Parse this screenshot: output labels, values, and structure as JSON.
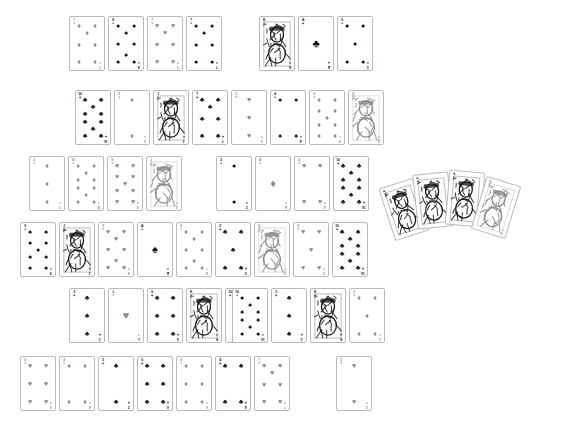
{
  "scene": {
    "title": "Playing Cards Layout",
    "background_color": "#ffffff",
    "card_border_color": "#b9b9b9",
    "red_suit_color": "#8a8a8a",
    "black_suit_color": "#111111",
    "card_width": 36,
    "card_height": 55
  },
  "suits": {
    "spades": "♠",
    "hearts": "♥",
    "diamonds": "♦",
    "clubs": "♣"
  },
  "grid": {
    "rows": [
      {
        "row_index": 1,
        "y": 16,
        "cards": [
          {
            "rank": "7",
            "suit": "diamonds",
            "color": "red",
            "x": 69,
            "face": false
          },
          {
            "rank": "8",
            "suit": "spades",
            "color": "black",
            "x": 108,
            "face": false
          },
          {
            "rank": "7",
            "suit": "hearts",
            "color": "red",
            "x": 147,
            "face": false
          },
          {
            "rank": "7",
            "suit": "spades",
            "color": "black",
            "x": 186,
            "face": false
          },
          {
            "rank": "K",
            "suit": "spades",
            "color": "black",
            "x": 259,
            "face": true
          },
          {
            "rank": "A",
            "suit": "clubs",
            "color": "black",
            "x": 298,
            "face": false
          },
          {
            "rank": "5",
            "suit": "spades",
            "color": "black",
            "x": 337,
            "face": false
          }
        ]
      },
      {
        "row_index": 2,
        "y": 90,
        "cards": [
          {
            "rank": "10",
            "suit": "clubs",
            "color": "black",
            "x": 75,
            "face": false
          },
          {
            "rank": "2",
            "suit": "diamonds",
            "color": "red",
            "x": 114,
            "face": false
          },
          {
            "rank": "J",
            "suit": "spades",
            "color": "black",
            "x": 153,
            "face": true
          },
          {
            "rank": "7",
            "suit": "clubs",
            "color": "black",
            "x": 192,
            "face": false
          },
          {
            "rank": "3",
            "suit": "hearts",
            "color": "red",
            "x": 231,
            "face": false
          },
          {
            "rank": "4",
            "suit": "spades",
            "color": "black",
            "x": 270,
            "face": false
          },
          {
            "rank": "9",
            "suit": "diamonds",
            "color": "red",
            "x": 309,
            "face": false
          },
          {
            "rank": "Q",
            "suit": "hearts",
            "color": "red",
            "x": 348,
            "face": true
          }
        ]
      },
      {
        "row_index": 3,
        "y": 156,
        "cards": [
          {
            "rank": "3",
            "suit": "diamonds",
            "color": "red",
            "x": 29,
            "face": false
          },
          {
            "rank": "10",
            "suit": "diamonds",
            "color": "red",
            "x": 68,
            "face": false
          },
          {
            "rank": "9",
            "suit": "hearts",
            "color": "red",
            "x": 107,
            "face": false
          },
          {
            "rank": "J",
            "suit": "diamonds",
            "color": "red",
            "x": 146,
            "face": true
          },
          {
            "rank": "2",
            "suit": "spades",
            "color": "black",
            "x": 216,
            "face": false
          },
          {
            "rank": "A",
            "suit": "diamonds",
            "color": "red",
            "x": 255,
            "face": false
          },
          {
            "rank": "4",
            "suit": "hearts",
            "color": "red",
            "x": 294,
            "face": false
          },
          {
            "rank": "10",
            "suit": "clubs",
            "color": "black",
            "x": 333,
            "face": false
          }
        ]
      },
      {
        "row_index": 4,
        "y": 222,
        "cards": [
          {
            "rank": "9",
            "suit": "spades",
            "color": "black",
            "x": 20,
            "face": false
          },
          {
            "rank": "J",
            "suit": "clubs",
            "color": "black",
            "x": 59,
            "face": true
          },
          {
            "rank": "8",
            "suit": "hearts",
            "color": "red",
            "x": 98,
            "face": false
          },
          {
            "rank": "A",
            "suit": "spades",
            "color": "black",
            "x": 137,
            "face": false
          },
          {
            "rank": "8",
            "suit": "diamonds",
            "color": "red",
            "x": 176,
            "face": false
          },
          {
            "rank": "5",
            "suit": "clubs",
            "color": "black",
            "x": 215,
            "face": false
          },
          {
            "rank": "Q",
            "suit": "diamonds",
            "color": "red",
            "x": 254,
            "face": true
          },
          {
            "rank": "5",
            "suit": "hearts",
            "color": "red",
            "x": 293,
            "face": false
          },
          {
            "rank": "10",
            "suit": "clubs",
            "color": "black",
            "x": 332,
            "face": false
          }
        ]
      },
      {
        "row_index": 5,
        "y": 288,
        "cards": [
          {
            "rank": "3",
            "suit": "clubs",
            "color": "black",
            "x": 69,
            "face": false
          },
          {
            "rank": "A",
            "suit": "hearts",
            "color": "red",
            "x": 108,
            "face": false
          },
          {
            "rank": "6",
            "suit": "clubs",
            "color": "black",
            "x": 147,
            "face": false
          },
          {
            "rank": "K",
            "suit": "spades",
            "color": "black",
            "x": 186,
            "face": true
          },
          {
            "rank": "10",
            "suit": "clubs",
            "color": "black",
            "x": 225,
            "face": false
          },
          {
            "rank": "10",
            "suit": "spades",
            "color": "black",
            "x": 232,
            "face": false
          },
          {
            "rank": "3",
            "suit": "clubs",
            "color": "black",
            "x": 271,
            "face": false
          },
          {
            "rank": "K",
            "suit": "clubs",
            "color": "black",
            "x": 310,
            "face": true
          },
          {
            "rank": "5",
            "suit": "diamonds",
            "color": "red",
            "x": 349,
            "face": false
          }
        ]
      },
      {
        "row_index": 6,
        "y": 356,
        "cards": [
          {
            "rank": "6",
            "suit": "hearts",
            "color": "red",
            "x": 20,
            "face": false
          },
          {
            "rank": "4",
            "suit": "diamonds",
            "color": "red",
            "x": 59,
            "face": false
          },
          {
            "rank": "2",
            "suit": "clubs",
            "color": "black",
            "x": 98,
            "face": false
          },
          {
            "rank": "6",
            "suit": "clubs",
            "color": "black",
            "x": 137,
            "face": false
          },
          {
            "rank": "6",
            "suit": "diamonds",
            "color": "red",
            "x": 176,
            "face": false
          },
          {
            "rank": "4",
            "suit": "clubs",
            "color": "black",
            "x": 215,
            "face": false
          },
          {
            "rank": "7",
            "suit": "hearts",
            "color": "red",
            "x": 254,
            "face": false
          },
          {
            "rank": "2",
            "suit": "hearts",
            "color": "red",
            "x": 336,
            "face": false
          }
        ]
      }
    ]
  },
  "fan": {
    "label": "fanned-hand",
    "origin_x": 386,
    "origin_y": 170,
    "cards": [
      {
        "rank": "K",
        "suit": "clubs",
        "color": "black",
        "x": 0,
        "y": 12,
        "rotate": -18,
        "face": true
      },
      {
        "rank": "K",
        "suit": "spades",
        "color": "black",
        "x": 29,
        "y": 3,
        "rotate": -6,
        "face": true
      },
      {
        "rank": "K",
        "suit": "spades",
        "color": "black",
        "x": 61,
        "y": 1,
        "rotate": 5,
        "face": true
      },
      {
        "rank": "Q",
        "suit": "diamonds",
        "color": "red",
        "x": 92,
        "y": 10,
        "rotate": 17,
        "face": true
      }
    ]
  }
}
